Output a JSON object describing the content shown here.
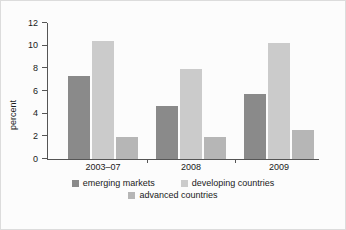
{
  "chart_data": {
    "type": "bar",
    "title": "",
    "subtitle": "",
    "xlabel": "",
    "ylabel": "percent",
    "categories": [
      "2003–07",
      "2008",
      "2009"
    ],
    "series": [
      {
        "name": "emerging markets",
        "color": "#8a8a8a",
        "values": [
          7.3,
          4.7,
          5.7
        ]
      },
      {
        "name": "developing countries",
        "color": "#cbcbcb",
        "values": [
          10.4,
          7.9,
          10.2
        ]
      },
      {
        "name": "advanced countries",
        "color": "#b6b6b6",
        "values": [
          1.9,
          1.9,
          2.6
        ]
      }
    ],
    "ylim": [
      0,
      12
    ],
    "yticks": [
      0,
      2,
      4,
      6,
      8,
      10,
      12
    ],
    "ytick_labels": [
      "0",
      "2",
      "4",
      "6",
      "8",
      "10",
      "12"
    ],
    "grid": false,
    "legend_position": "bottom",
    "legend_rows": [
      [
        "emerging markets",
        "developing countries"
      ],
      [
        "advanced countries"
      ]
    ]
  },
  "figure": {
    "background_color": "#fcfcfc",
    "border_color": "#dcdcdc",
    "axis_color": "#555555",
    "text_color": "#1a1a1a"
  }
}
